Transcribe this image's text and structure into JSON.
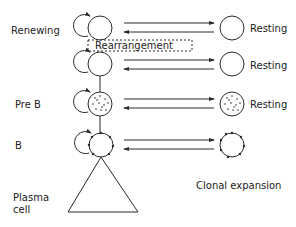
{
  "diagram": {
    "stages": [
      {
        "label": "Renewing",
        "cell_type": "empty",
        "resting_label": "Resting"
      },
      {
        "label": "",
        "cell_type": "empty",
        "resting_label": "Resting"
      },
      {
        "label": "Pre B",
        "cell_type": "dotted",
        "resting_label": "Resting"
      },
      {
        "label": "B",
        "cell_type": "receptors",
        "resting_label": ""
      }
    ],
    "rearrangement_label": "Rearrangement",
    "plasma_label_line1": "Plasma",
    "plasma_label_line2": "cell",
    "clonal_label": "Clonal expansion",
    "colors": {
      "stroke": "#2a2a2a",
      "background": "#ffffff"
    }
  }
}
